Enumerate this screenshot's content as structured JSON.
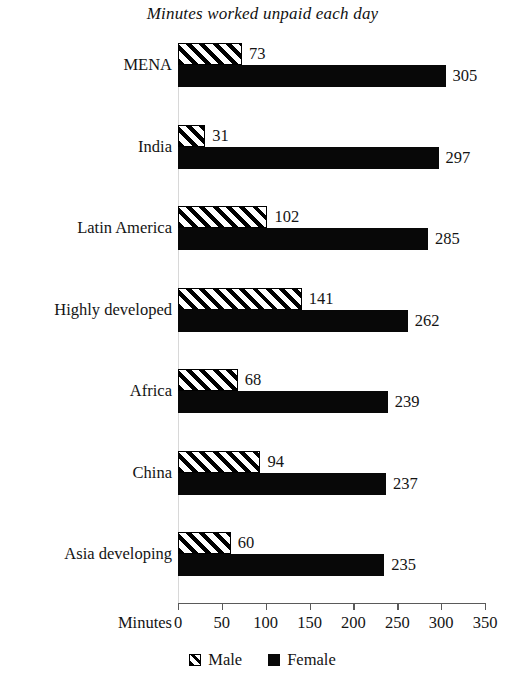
{
  "chart_data": {
    "type": "bar",
    "orientation": "horizontal",
    "title": "Minutes worked unpaid each day",
    "xlabel": "Minutes",
    "ylabel": "",
    "xlim": [
      0,
      350
    ],
    "xticks": [
      0,
      50,
      100,
      150,
      200,
      250,
      300,
      350
    ],
    "xtick_labels": [
      "0",
      "50",
      "100",
      "150",
      "200",
      "250",
      "300",
      "350"
    ],
    "grid": false,
    "legend_position": "bottom",
    "categories": [
      "MENA",
      "India",
      "Latin America",
      "Highly developed",
      "Africa",
      "China",
      "Asia developing"
    ],
    "series": [
      {
        "name": "Male",
        "pattern": "diagonal-hatch",
        "color": "#ffffff",
        "values": [
          73,
          31,
          102,
          141,
          68,
          94,
          60
        ],
        "value_labels": [
          "73",
          "31",
          "102",
          "141",
          "68",
          "94",
          "60"
        ]
      },
      {
        "name": "Female",
        "pattern": "solid",
        "color": "#080808",
        "values": [
          305,
          297,
          285,
          262,
          239,
          237,
          235
        ],
        "value_labels": [
          "305",
          "297",
          "285",
          "262",
          "239",
          "237",
          "235"
        ]
      }
    ]
  },
  "legend": {
    "items": [
      {
        "label": "Male",
        "swatch": "hatched-square-icon"
      },
      {
        "label": "Female",
        "swatch": "filled-square-icon"
      }
    ]
  }
}
